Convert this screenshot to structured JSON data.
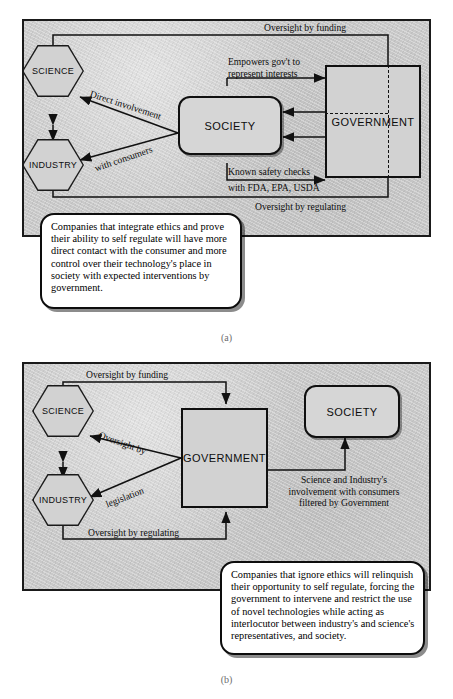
{
  "figure": {
    "caption_a": "(a)",
    "caption_b": "(b)"
  },
  "panel_a": {
    "nodes": {
      "science": "SCIENCE",
      "industry": "INDUSTRY",
      "society": "SOCIETY",
      "government": "GOVERNMENT"
    },
    "labels": {
      "oversight_funding": "Oversight by funding",
      "empowers_line1": "Empowers gov't to",
      "empowers_line2": "represent interests",
      "direct_involvement": "Direct involvement",
      "with_consumers": "with consumers",
      "known_safety_line1": "Known safety checks",
      "known_safety_line2": "with FDA, EPA, USDA",
      "oversight_regulating": "Oversight by regulating"
    },
    "callout": "Companies that integrate ethics and prove their ability to self regulate will have more direct contact with the consumer and more control over their technology's place in society with expected interventions by government."
  },
  "panel_b": {
    "nodes": {
      "science": "SCIENCE",
      "industry": "INDUSTRY",
      "government": "GOVERNMENT",
      "society": "SOCIETY"
    },
    "labels": {
      "oversight_funding": "Oversight by funding",
      "oversight_by": "Oversight by",
      "legislation": "legislation",
      "oversight_regulating": "Oversight by regulating",
      "filtered_block": "Science and Industry's involvement with consumers filtered by Government"
    },
    "callout": "Companies that ignore ethics will relinquish their opportunity to self regulate, forcing the government to intervene and restrict the use of novel technologies while acting as interlocutor between industry's and science's representatives, and society."
  },
  "colors": {
    "panel_bg": "#c9c9c9",
    "stroke": "#101010",
    "callout_bg": "#ffffff",
    "caption": "#6d6d6d"
  }
}
